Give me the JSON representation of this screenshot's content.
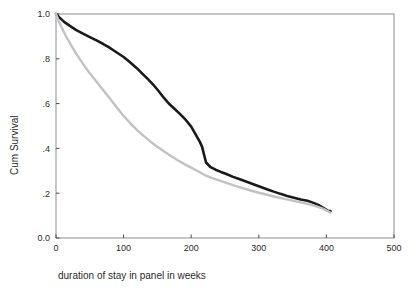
{
  "chart_data": {
    "type": "line",
    "title": "",
    "xlabel": "duration of stay in panel in weeks",
    "ylabel": "Cum Survival",
    "xlim": [
      0,
      500
    ],
    "ylim": [
      0.0,
      1.0
    ],
    "grid": false,
    "legend": "none",
    "xticks": [
      0,
      100,
      200,
      300,
      400,
      500
    ],
    "xtick_labels": [
      "0",
      "100",
      "200",
      "300",
      "400",
      "500"
    ],
    "yticks": [
      0.0,
      0.2,
      0.4,
      0.6,
      0.8,
      1.0
    ],
    "ytick_labels": [
      "0.0",
      ".2",
      ".4",
      ".6",
      ".8",
      "1.0"
    ],
    "series": [
      {
        "name": "black-curve",
        "color": "#1a1a1a",
        "width": 2.6,
        "x": [
          0,
          5,
          12,
          20,
          30,
          40,
          50,
          60,
          70,
          78,
          86,
          95,
          100,
          106,
          112,
          120,
          128,
          136,
          144,
          152,
          160,
          168,
          176,
          184,
          192,
          200,
          208,
          213,
          216,
          219,
          222,
          228,
          236,
          244,
          252,
          262,
          272,
          282,
          292,
          302,
          312,
          322,
          332,
          342,
          352,
          362,
          372,
          380,
          388,
          396,
          402,
          406
        ],
        "y": [
          1.0,
          0.985,
          0.965,
          0.948,
          0.928,
          0.912,
          0.897,
          0.882,
          0.866,
          0.852,
          0.836,
          0.818,
          0.808,
          0.793,
          0.778,
          0.757,
          0.733,
          0.709,
          0.684,
          0.655,
          0.624,
          0.597,
          0.575,
          0.552,
          0.527,
          0.497,
          0.455,
          0.428,
          0.408,
          0.372,
          0.337,
          0.318,
          0.305,
          0.295,
          0.286,
          0.273,
          0.262,
          0.251,
          0.24,
          0.229,
          0.218,
          0.207,
          0.197,
          0.188,
          0.18,
          0.172,
          0.166,
          0.158,
          0.148,
          0.133,
          0.122,
          0.12
        ]
      },
      {
        "name": "gray-curve",
        "color": "#c2c2c2",
        "width": 2.4,
        "x": [
          0,
          6,
          14,
          22,
          30,
          40,
          50,
          60,
          70,
          80,
          90,
          100,
          110,
          120,
          130,
          140,
          150,
          160,
          170,
          180,
          190,
          200,
          210,
          220,
          230,
          240,
          252,
          264,
          276,
          288,
          300,
          312,
          324,
          336,
          348,
          360,
          372,
          384,
          394,
          402,
          406
        ],
        "y": [
          1.0,
          0.955,
          0.905,
          0.862,
          0.822,
          0.777,
          0.735,
          0.697,
          0.66,
          0.622,
          0.583,
          0.545,
          0.512,
          0.482,
          0.455,
          0.43,
          0.407,
          0.386,
          0.366,
          0.347,
          0.33,
          0.314,
          0.298,
          0.281,
          0.268,
          0.258,
          0.246,
          0.234,
          0.223,
          0.212,
          0.202,
          0.193,
          0.184,
          0.176,
          0.168,
          0.16,
          0.152,
          0.142,
          0.132,
          0.12,
          0.113
        ]
      }
    ]
  },
  "axes": {
    "y_axis_title": "Cum Survival",
    "x_axis_title": "duration of stay in panel in weeks"
  }
}
